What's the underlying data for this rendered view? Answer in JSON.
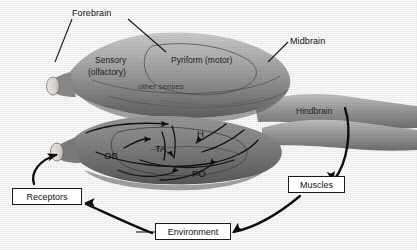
{
  "figure": {
    "colors": {
      "ink": "#1a1a1a",
      "brain_light": "#b9b9b9",
      "brain_mid": "#8e8e8e",
      "brain_dark": "#5d5d5d",
      "stub_pale": "#e8e6e0",
      "box_fill": "#ffffff",
      "background": "#fdfdfd"
    }
  },
  "upper_brain": {
    "region_labels": [
      {
        "id": "forebrain",
        "text": "Forebrain",
        "x": 72,
        "y": 8
      },
      {
        "id": "midbrain",
        "text": "Midbrain",
        "x": 290,
        "y": 36
      },
      {
        "id": "hindbrain",
        "text": "Hindbrain",
        "x": 296,
        "y": 106
      },
      {
        "id": "sensory",
        "text": "Sensory",
        "x": 95,
        "y": 55
      },
      {
        "id": "olfactory",
        "text": "(olfactory)",
        "x": 88,
        "y": 67
      },
      {
        "id": "pyriform",
        "text": "Pyriform (motor)",
        "x": 171,
        "y": 55
      },
      {
        "id": "othersenses",
        "text": "other senses",
        "x": 138,
        "y": 82
      },
      {
        "id": "hippocampus",
        "text": "Hippocampus",
        "x": 160,
        "y": 99
      }
    ]
  },
  "lower_brain": {
    "structure_labels": [
      {
        "id": "ob",
        "text": "OB",
        "x": 104,
        "y": 150
      },
      {
        "id": "ta",
        "text": "TA",
        "x": 155,
        "y": 143
      },
      {
        "id": "h",
        "text": "H",
        "x": 197,
        "y": 128
      },
      {
        "id": "po",
        "text": "PO",
        "x": 192,
        "y": 168
      }
    ]
  },
  "loop_boxes": [
    {
      "id": "receptors",
      "label": "Receptors",
      "x": 12,
      "y": 188,
      "w": 70,
      "h": 17
    },
    {
      "id": "muscles",
      "label": "Muscles",
      "x": 288,
      "y": 176,
      "w": 57,
      "h": 17
    },
    {
      "id": "environment",
      "label": "Environment",
      "x": 155,
      "y": 223,
      "w": 76,
      "h": 17
    }
  ]
}
